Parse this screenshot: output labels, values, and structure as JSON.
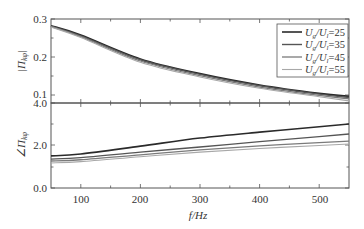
{
  "chart_data": [
    {
      "type": "line",
      "panel": "top",
      "ylabel": "|Π_{kφ}|",
      "xlabel": "",
      "xlim": [
        50,
        550
      ],
      "ylim": [
        0.1,
        0.3
      ],
      "yticks": [
        "0.1",
        "0.2",
        "0.3"
      ],
      "x": [
        50,
        100,
        200,
        300,
        400,
        500,
        550
      ],
      "series": [
        {
          "name": "Ug/Ul=25",
          "values": [
            0.284,
            0.262,
            0.205,
            0.17,
            0.143,
            0.123,
            0.116
          ]
        },
        {
          "name": "Ug/Ul=35",
          "values": [
            0.283,
            0.26,
            0.203,
            0.168,
            0.141,
            0.121,
            0.113
          ]
        },
        {
          "name": "Ug/Ul=45",
          "values": [
            0.282,
            0.258,
            0.2,
            0.165,
            0.138,
            0.118,
            0.11
          ]
        },
        {
          "name": "Ug/Ul=55",
          "values": [
            0.281,
            0.256,
            0.197,
            0.162,
            0.135,
            0.115,
            0.105
          ]
        }
      ],
      "legend": {
        "position": "upper right",
        "entries": [
          "Ug/Ul=25",
          "Ug/Ul=35",
          "Ug/Ul=45",
          "Ug/Ul=55"
        ]
      }
    },
    {
      "type": "line",
      "panel": "bottom",
      "ylabel": "∠Π_{kφ}",
      "xlabel": "f/Hz",
      "xlim": [
        50,
        550
      ],
      "ylim": [
        0.0,
        4.0
      ],
      "yticks": [
        "0.0",
        "2.0",
        "4.0"
      ],
      "xticks": [
        "100",
        "200",
        "300",
        "400",
        "500"
      ],
      "x": [
        50,
        100,
        200,
        300,
        400,
        500,
        550
      ],
      "series": [
        {
          "name": "Ug/Ul=25",
          "values": [
            1.51,
            1.6,
            1.97,
            2.35,
            2.63,
            2.88,
            3.01
          ]
        },
        {
          "name": "Ug/Ul=35",
          "values": [
            1.36,
            1.43,
            1.69,
            1.93,
            2.18,
            2.42,
            2.54
          ]
        },
        {
          "name": "Ug/Ul=45",
          "values": [
            1.27,
            1.33,
            1.56,
            1.79,
            1.98,
            2.14,
            2.21
          ]
        },
        {
          "name": "Ug/Ul=55",
          "values": [
            1.18,
            1.24,
            1.47,
            1.69,
            1.86,
            2.0,
            2.07
          ]
        }
      ]
    }
  ],
  "labels": {
    "top_ylabel_main": "|Π",
    "top_ylabel_sub": "kφ",
    "bottom_ylabel_main": "∠Π",
    "bottom_ylabel_sub": "kφ",
    "xlabel": "f/Hz",
    "top_yticks": [
      "0.3",
      "0.2",
      "0.1"
    ],
    "bottom_yticks": [
      "4.0",
      "2.0",
      "0.0"
    ],
    "xticks": [
      "100",
      "200",
      "300",
      "400",
      "500"
    ],
    "legend": [
      "25",
      "35",
      "45",
      "55"
    ]
  },
  "colors": {
    "series": [
      "#2a2a2a",
      "#555555",
      "#7a7a7a",
      "#a8a8a8"
    ],
    "axis": "#555555"
  }
}
